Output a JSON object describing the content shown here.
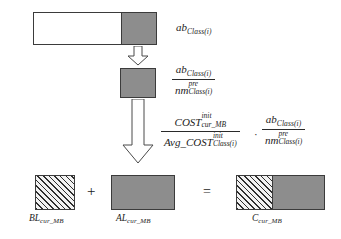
{
  "figure": {
    "type": "diagram"
  },
  "labels": {
    "stage1": {
      "symbol": "ab",
      "subscript": "Class(i)"
    },
    "stage2_fraction": {
      "numerator_symbol": "ab",
      "numerator_subscript": "Class(i)",
      "denominator_symbol": "nm",
      "denominator_superscript": "pre",
      "denominator_subscript": "Class(i)"
    },
    "stage3_fraction_left": {
      "numerator_symbol": "COST",
      "numerator_superscript": "init",
      "numerator_subscript": "cur_MB",
      "denominator_symbol": "Avg_COST",
      "denominator_superscript": "init",
      "denominator_subscript": "Class(i)"
    },
    "stage3_fraction_right": {
      "numerator_symbol": "ab",
      "numerator_subscript": "Class(i)",
      "denominator_symbol": "nm",
      "denominator_superscript": "pre",
      "denominator_subscript": "Class(i)"
    },
    "bottom": {
      "bl_symbol": "BL",
      "bl_subscript": "cur_MB",
      "al_symbol": "AL",
      "al_subscript": "cur_MB",
      "c_symbol": "C",
      "c_subscript": "cur_MB"
    }
  },
  "operators": {
    "plus": "+",
    "equals": "=",
    "multiply": "·"
  },
  "colors": {
    "fill_gray": "#8d8d8d",
    "fill_white": "#ffffff",
    "stroke": "#3b3b3b",
    "hatch_line": "#2e2e2e",
    "text": "#1c1c1c"
  }
}
